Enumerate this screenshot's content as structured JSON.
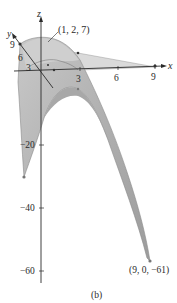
{
  "figure": {
    "caption": "(b)",
    "axes": {
      "x": {
        "label": "x",
        "ticks": [
          "3",
          "6",
          "9"
        ]
      },
      "y": {
        "label": "y",
        "ticks": [
          "3",
          "6",
          "9"
        ]
      },
      "z": {
        "label": "z",
        "ticks": [
          "−20",
          "−40",
          "−60"
        ]
      }
    },
    "annotations": {
      "top_point": "(1, 2, 7)",
      "bottom_point": "(9, 0, −61)"
    },
    "colors": {
      "surface_fill": "#b5b5b5",
      "surface_light": "#d4d4d4",
      "plane_fill": "#d9d9d9",
      "axis": "#2a2a2a",
      "edge": "#8a8a8a"
    }
  }
}
